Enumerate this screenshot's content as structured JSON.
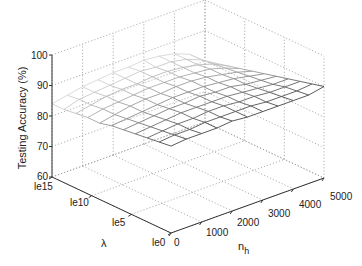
{
  "chart_data": {
    "type": "surface3d",
    "title": "",
    "xlabel": "n_h",
    "ylabel": "λ",
    "zlabel": "Testing Accuracy (%)",
    "x_ticks": [
      "0",
      "1000",
      "2000",
      "3000",
      "4000",
      "5000"
    ],
    "y_ticks": [
      "le0",
      "le5",
      "le10",
      "le15"
    ],
    "z_ticks": [
      "60",
      "70",
      "80",
      "90",
      "100"
    ],
    "xlim": [
      0,
      5000
    ],
    "ylim_log10": [
      0,
      15
    ],
    "zlim": [
      60,
      100
    ],
    "grid": true,
    "x": [
      0,
      500,
      1000,
      1500,
      2000,
      2500,
      3000,
      3500,
      4000,
      4500,
      5000
    ],
    "y_log10": [
      15,
      13.5,
      12,
      10.5,
      9,
      7.5,
      6,
      4.5,
      3,
      1.5,
      0
    ],
    "z": [
      [
        84,
        85,
        86,
        86.5,
        87,
        87,
        87.5,
        87,
        86,
        84,
        80
      ],
      [
        84,
        85.5,
        86,
        86.5,
        87,
        87.5,
        87,
        87,
        86,
        84,
        81
      ],
      [
        84.5,
        85.5,
        86.5,
        87,
        87,
        87.5,
        87.5,
        87,
        86,
        84.5,
        82
      ],
      [
        85,
        86,
        86.5,
        87,
        87.5,
        87.5,
        87.5,
        87,
        86.5,
        85,
        83
      ],
      [
        85,
        86,
        87,
        87.5,
        87.5,
        88,
        88,
        87.5,
        86.5,
        85.5,
        84
      ],
      [
        86,
        86.5,
        87,
        87.5,
        88,
        88,
        88,
        87.5,
        87,
        86,
        85
      ],
      [
        86.5,
        87,
        87.5,
        88,
        88,
        88.5,
        88,
        88,
        87,
        86.5,
        86
      ],
      [
        87,
        87.5,
        88,
        88.5,
        88.5,
        88.5,
        88.5,
        88,
        87.5,
        87,
        87
      ],
      [
        87.5,
        88,
        88.5,
        88.5,
        89,
        89,
        88.5,
        88.5,
        88,
        88,
        88
      ],
      [
        88,
        88.5,
        88.5,
        89,
        89,
        89,
        89,
        88.5,
        88.5,
        88.5,
        89
      ],
      [
        88.5,
        89,
        89,
        89,
        89.5,
        89,
        89,
        89,
        89,
        89,
        90
      ]
    ]
  },
  "axes": {
    "zlabel": "Testing Accuracy (%)",
    "xlabel_main": "n",
    "xlabel_sub": "h",
    "ylabel": "λ",
    "z_ticks": [
      "100",
      "90",
      "80",
      "70",
      "60"
    ],
    "y_ticks": [
      "le15",
      "le10",
      "le5",
      "le0"
    ],
    "x_ticks": [
      "0",
      "1000",
      "2000",
      "3000",
      "4000",
      "5000"
    ]
  },
  "colors": {
    "axis": "#333333",
    "grid": "#9a9a9a",
    "mesh_dark": "#4a4a4a",
    "mesh_light": "#d0d0d0"
  }
}
